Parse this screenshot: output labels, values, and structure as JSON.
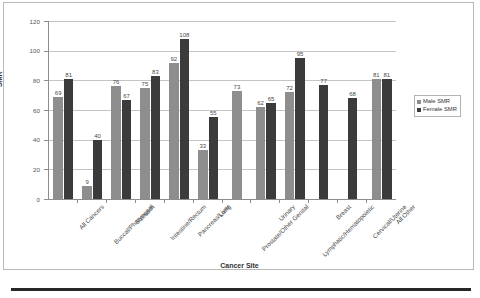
{
  "chart_data": {
    "type": "bar",
    "title": "",
    "xlabel": "Cancer Site",
    "ylabel": "SMR",
    "ylim": [
      0,
      120
    ],
    "yticks": [
      0,
      20,
      40,
      60,
      80,
      100,
      120
    ],
    "grid": "horizontal",
    "legend_position": "right",
    "categories": [
      "All Cancers",
      "Buccal/Pharyngeal",
      "Stomach",
      "Intestine/Rectum",
      "Pancreas/Liver",
      "Lung",
      "Prostate/Other Genital",
      "Urinary",
      "Lymphatic/Hematopoietic",
      "Breast",
      "Cervical/Uterine",
      "All Other"
    ],
    "series": [
      {
        "name": "Male SMR",
        "color": "#8e8e8e",
        "values": [
          69,
          9,
          76,
          75,
          92,
          33,
          73,
          62,
          72,
          null,
          null,
          81
        ]
      },
      {
        "name": "Female SMR",
        "color": "#3b3b3b",
        "values": [
          81,
          40,
          67,
          83,
          108,
          55,
          null,
          65,
          95,
          77,
          68,
          81
        ]
      }
    ]
  },
  "legend": {
    "items": [
      {
        "label": "Male SMR",
        "swatch": "male"
      },
      {
        "label": "Female SMR",
        "swatch": "female"
      }
    ]
  }
}
